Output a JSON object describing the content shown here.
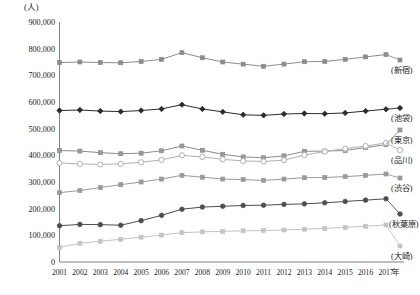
{
  "chart_data": {
    "type": "line",
    "title": "",
    "xlabel": "年",
    "ylabel": "(人)",
    "unit_label": "(人)",
    "ylim": [
      0,
      900000
    ],
    "ytick_step": 100000,
    "grid": false,
    "legend_position": "right",
    "categories": [
      "2001",
      "2002",
      "2003",
      "2004",
      "2005",
      "2006",
      "2007",
      "2008",
      "2009",
      "2010",
      "2011",
      "2012",
      "2013",
      "2014",
      "2015",
      "2016",
      "2017"
    ],
    "ytick_labels": [
      "900,000",
      "800,000",
      "700,000",
      "600,000",
      "500,000",
      "400,000",
      "300,000",
      "200,000",
      "100,000",
      "0"
    ],
    "ytick_values": [
      900000,
      800000,
      700000,
      600000,
      500000,
      400000,
      300000,
      200000,
      100000,
      0
    ],
    "series": [
      {
        "name": "新宿",
        "color": "#8c8c8c",
        "marker": "square",
        "marker_fill": "#8c8c8c",
        "values": [
          748000,
          750000,
          748000,
          747000,
          752000,
          760000,
          785000,
          766000,
          750000,
          742000,
          734000,
          742000,
          751000,
          752000,
          760000,
          769000,
          778000
        ]
      },
      {
        "name": "池袋",
        "color": "#2b2b2b",
        "marker": "diamond",
        "marker_fill": "#2b2b2b",
        "values": [
          568000,
          570000,
          566000,
          564000,
          568000,
          574000,
          590000,
          574000,
          563000,
          552000,
          550000,
          555000,
          557000,
          556000,
          559000,
          566000,
          573000
        ]
      },
      {
        "name": "東京",
        "color": "#8c8c8c",
        "marker": "square",
        "marker_fill": "#9a9a9a",
        "values": [
          418000,
          416000,
          410000,
          406000,
          408000,
          417000,
          435000,
          419000,
          404000,
          394000,
          391000,
          398000,
          415000,
          416000,
          418000,
          429000,
          440000
        ]
      },
      {
        "name": "品川",
        "color": "#b0b0b0",
        "marker": "circle-open",
        "marker_fill": "#ffffff",
        "values": [
          371000,
          368000,
          366000,
          368000,
          374000,
          383000,
          400000,
          394000,
          385000,
          379000,
          377000,
          382000,
          401000,
          414000,
          425000,
          435000,
          446000
        ]
      },
      {
        "name": "渋谷",
        "color": "#9a9a9a",
        "marker": "square",
        "marker_fill": "#9a9a9a",
        "values": [
          260000,
          268000,
          279000,
          290000,
          300000,
          311000,
          325000,
          318000,
          311000,
          309000,
          306000,
          311000,
          316000,
          317000,
          320000,
          325000,
          330000
        ]
      },
      {
        "name": "秋葉原",
        "color": "#4d4d4d",
        "marker": "circle",
        "marker_fill": "#4d4d4d",
        "values": [
          136000,
          141000,
          140000,
          138000,
          155000,
          175000,
          198000,
          206000,
          209000,
          212000,
          213000,
          216000,
          218000,
          222000,
          227000,
          232000,
          237000
        ]
      },
      {
        "name": "大崎",
        "color": "#c4c4c4",
        "marker": "square",
        "marker_fill": "#c4c4c4",
        "values": [
          55000,
          70000,
          78000,
          85000,
          93000,
          101000,
          110000,
          113000,
          115000,
          117000,
          118000,
          120000,
          123000,
          126000,
          130000,
          134000,
          139000
        ]
      }
    ],
    "legend_entries": [
      {
        "label": "(新宿)",
        "series": "新宿"
      },
      {
        "label": "(池袋)",
        "series": "池袋"
      },
      {
        "label": "(東京)",
        "series": "東京"
      },
      {
        "label": "(品川)",
        "series": "品川"
      },
      {
        "label": "(渋谷)",
        "series": "渋谷"
      },
      {
        "label": "(秋葉原)",
        "series": "秋葉原"
      },
      {
        "label": "(大崎)",
        "series": "大崎"
      }
    ]
  }
}
